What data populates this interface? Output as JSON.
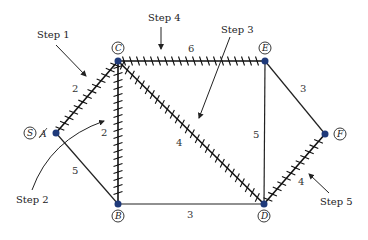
{
  "diagram": {
    "type": "graph-shortest-path",
    "nodes": [
      {
        "id": "A",
        "label": "A",
        "x": 56,
        "y": 133,
        "circled_label": "S",
        "note": "A struck through, relabeled S"
      },
      {
        "id": "B",
        "label": "B",
        "x": 118,
        "y": 204
      },
      {
        "id": "C",
        "label": "C",
        "x": 118,
        "y": 61
      },
      {
        "id": "D",
        "label": "D",
        "x": 264,
        "y": 204
      },
      {
        "id": "E",
        "label": "E",
        "x": 265,
        "y": 61
      },
      {
        "id": "F",
        "label": "F",
        "x": 325,
        "y": 134
      }
    ],
    "edges": [
      {
        "from": "A",
        "to": "C",
        "weight": "2",
        "hatched": true
      },
      {
        "from": "A",
        "to": "B",
        "weight": "5",
        "hatched": false
      },
      {
        "from": "C",
        "to": "B",
        "weight": "2",
        "hatched": true
      },
      {
        "from": "C",
        "to": "E",
        "weight": "6",
        "hatched": true
      },
      {
        "from": "C",
        "to": "D",
        "weight": "4",
        "hatched": true
      },
      {
        "from": "E",
        "to": "D",
        "weight": "5",
        "hatched": false
      },
      {
        "from": "E",
        "to": "F",
        "weight": "3",
        "hatched": false
      },
      {
        "from": "B",
        "to": "D",
        "weight": "3",
        "hatched": false
      },
      {
        "from": "D",
        "to": "F",
        "weight": "4",
        "hatched": true
      }
    ],
    "annotations": [
      {
        "text": "Step 1"
      },
      {
        "text": "Step 2"
      },
      {
        "text": "Step 3"
      },
      {
        "text": "Step 4"
      },
      {
        "text": "Step 5"
      }
    ],
    "colors": {
      "node": "#1f3a7a",
      "edge": "#222222",
      "hatch": "#111111"
    }
  }
}
